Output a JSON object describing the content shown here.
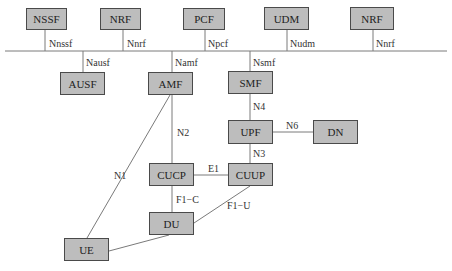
{
  "diagram": {
    "title": "",
    "colors": {
      "box_fill": "#bdbdbd",
      "box_border": "#4a4a4a",
      "line": "#7a7a7a"
    },
    "nodes": [
      {
        "id": "nssf",
        "label": "NSSF",
        "x": 26,
        "y": 8,
        "w": 41,
        "h": 22
      },
      {
        "id": "nrf1",
        "label": "NRF",
        "x": 100,
        "y": 8,
        "w": 41,
        "h": 22
      },
      {
        "id": "pcf",
        "label": "PCF",
        "x": 183,
        "y": 8,
        "w": 42,
        "h": 22
      },
      {
        "id": "udm",
        "label": "UDM",
        "x": 264,
        "y": 7,
        "w": 45,
        "h": 23
      },
      {
        "id": "nrf2",
        "label": "NRF",
        "x": 350,
        "y": 7,
        "w": 44,
        "h": 23
      },
      {
        "id": "ausf",
        "label": "AUSF",
        "x": 60,
        "y": 72,
        "w": 45,
        "h": 23
      },
      {
        "id": "amf",
        "label": "AMF",
        "x": 148,
        "y": 72,
        "w": 45,
        "h": 23
      },
      {
        "id": "smf",
        "label": "SMF",
        "x": 228,
        "y": 71,
        "w": 45,
        "h": 23
      },
      {
        "id": "upf",
        "label": "UPF",
        "x": 228,
        "y": 120,
        "w": 45,
        "h": 24
      },
      {
        "id": "dn",
        "label": "DN",
        "x": 313,
        "y": 120,
        "w": 45,
        "h": 24
      },
      {
        "id": "cucp",
        "label": "CUCP",
        "x": 149,
        "y": 163,
        "w": 45,
        "h": 23
      },
      {
        "id": "cuup",
        "label": "CUUP",
        "x": 228,
        "y": 163,
        "w": 45,
        "h": 23
      },
      {
        "id": "du",
        "label": "DU",
        "x": 149,
        "y": 212,
        "w": 45,
        "h": 23
      },
      {
        "id": "ue",
        "label": "UE",
        "x": 64,
        "y": 238,
        "w": 45,
        "h": 23
      }
    ],
    "bus": {
      "x1": 5,
      "x2": 447,
      "y": 51
    },
    "edges": [
      {
        "id": "nnssf",
        "label": "Nnssf",
        "x1": 45,
        "y1": 30,
        "x2": 45,
        "y2": 51,
        "lx": 49,
        "ly": 39
      },
      {
        "id": "nnrf1",
        "label": "Nnrf",
        "x1": 123,
        "y1": 30,
        "x2": 123,
        "y2": 51,
        "lx": 127,
        "ly": 39
      },
      {
        "id": "npcf",
        "label": "Npcf",
        "x1": 205,
        "y1": 30,
        "x2": 205,
        "y2": 51,
        "lx": 208,
        "ly": 39
      },
      {
        "id": "nudm",
        "label": "Nudm",
        "x1": 287,
        "y1": 30,
        "x2": 287,
        "y2": 51,
        "lx": 290,
        "ly": 39
      },
      {
        "id": "nnrf2",
        "label": "Nnrf",
        "x1": 373,
        "y1": 30,
        "x2": 373,
        "y2": 51,
        "lx": 376,
        "ly": 39
      },
      {
        "id": "nausf",
        "label": "Nausf",
        "x1": 83,
        "y1": 51,
        "x2": 83,
        "y2": 72,
        "lx": 86,
        "ly": 58
      },
      {
        "id": "namf",
        "label": "Namf",
        "x1": 172,
        "y1": 51,
        "x2": 172,
        "y2": 72,
        "lx": 175,
        "ly": 58
      },
      {
        "id": "nsmf",
        "label": "Nsmf",
        "x1": 250,
        "y1": 51,
        "x2": 250,
        "y2": 71,
        "lx": 253,
        "ly": 58
      },
      {
        "id": "n4",
        "label": "N4",
        "x1": 250,
        "y1": 94,
        "x2": 250,
        "y2": 120,
        "lx": 253,
        "ly": 102
      },
      {
        "id": "n6",
        "label": "N6",
        "x1": 273,
        "y1": 132,
        "x2": 313,
        "y2": 132,
        "lx": 286,
        "ly": 121
      },
      {
        "id": "n3",
        "label": "N3",
        "x1": 250,
        "y1": 144,
        "x2": 250,
        "y2": 163,
        "lx": 253,
        "ly": 149
      },
      {
        "id": "n2",
        "label": "N2",
        "x1": 172,
        "y1": 95,
        "x2": 172,
        "y2": 163,
        "lx": 177,
        "ly": 128
      },
      {
        "id": "n1",
        "label": "N1",
        "x1": 170,
        "y1": 95,
        "x2": 87,
        "y2": 238,
        "lx": 114,
        "ly": 171
      },
      {
        "id": "e1",
        "label": "E1",
        "x1": 194,
        "y1": 175,
        "x2": 228,
        "y2": 175,
        "lx": 208,
        "ly": 164
      },
      {
        "id": "f1c",
        "label": "F1−C",
        "x1": 172,
        "y1": 186,
        "x2": 172,
        "y2": 212,
        "lx": 176,
        "ly": 195
      },
      {
        "id": "f1u",
        "label": "F1−U",
        "x1": 250,
        "y1": 186,
        "x2": 194,
        "y2": 223,
        "lx": 227,
        "ly": 201
      },
      {
        "id": "ue-du",
        "label": "",
        "x1": 109,
        "y1": 251,
        "x2": 169,
        "y2": 235,
        "lx": 0,
        "ly": 0
      }
    ]
  }
}
